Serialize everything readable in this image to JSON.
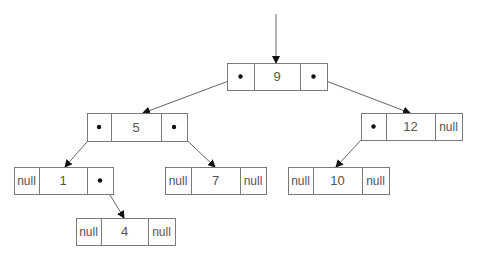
{
  "diagram": {
    "colors": {
      "border": "#7a7a7a",
      "text": "#555555",
      "edge": "#666666",
      "dot": "#111111",
      "background": "#ffffff"
    },
    "entry_arrow": {
      "x": 276,
      "y1": 14,
      "y2": 63
    },
    "nodes": [
      {
        "id": "n9",
        "value": "9",
        "left": "•",
        "right": "•",
        "x": 227,
        "y": 63,
        "w": 100,
        "h": 27,
        "d1": 254,
        "d2": 300
      },
      {
        "id": "n5",
        "value": "5",
        "left": "•",
        "right": "•",
        "x": 87,
        "y": 113,
        "w": 100,
        "h": 28,
        "d1": 111,
        "d2": 161
      },
      {
        "id": "n12",
        "value": "12",
        "left": "•",
        "right": "null",
        "x": 361,
        "y": 113,
        "w": 101,
        "h": 27,
        "d1": 386,
        "d2": 435
      },
      {
        "id": "n1",
        "value": "1",
        "left": "null",
        "right": "•",
        "x": 14,
        "y": 167,
        "w": 99,
        "h": 27,
        "d1": 39,
        "d2": 87
      },
      {
        "id": "n7",
        "value": "7",
        "left": "null",
        "right": "null",
        "x": 165,
        "y": 167,
        "w": 101,
        "h": 27,
        "d1": 191,
        "d2": 240
      },
      {
        "id": "n10",
        "value": "10",
        "left": "null",
        "right": "null",
        "x": 288,
        "y": 167,
        "w": 101,
        "h": 27,
        "d1": 313,
        "d2": 362
      },
      {
        "id": "n4",
        "value": "4",
        "left": "null",
        "right": "null",
        "x": 76,
        "y": 218,
        "w": 99,
        "h": 27,
        "d1": 101,
        "d2": 148
      }
    ],
    "edges": [
      {
        "from": "n9.left",
        "to": "n5",
        "x1": 242,
        "y1": 76,
        "x2": 143,
        "y2": 113
      },
      {
        "from": "n9.right",
        "to": "n12",
        "x1": 313,
        "y1": 76,
        "x2": 410,
        "y2": 113
      },
      {
        "from": "n5.left",
        "to": "n1",
        "x1": 100,
        "y1": 127,
        "x2": 65,
        "y2": 167
      },
      {
        "from": "n5.right",
        "to": "n7",
        "x1": 173,
        "y1": 127,
        "x2": 215,
        "y2": 167
      },
      {
        "from": "n12.left",
        "to": "n10",
        "x1": 374,
        "y1": 126,
        "x2": 336,
        "y2": 167
      },
      {
        "from": "n1.right",
        "to": "n4",
        "x1": 101,
        "y1": 180,
        "x2": 124,
        "y2": 218
      }
    ]
  }
}
